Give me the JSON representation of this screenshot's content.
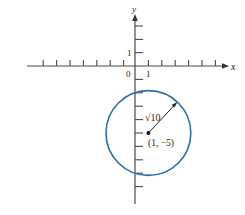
{
  "figure": {
    "type": "circle-on-coordinate-plane",
    "axes": {
      "x_label": "x",
      "y_label": "y",
      "origin_label": "0",
      "x_unit_label": "1",
      "y_unit_label": "1",
      "x_range": [
        -7,
        7
      ],
      "y_range": [
        -9,
        4
      ]
    },
    "circle": {
      "center": [
        1,
        -5
      ],
      "radius_label": "√10",
      "radius_value": 3.1623,
      "center_label": "(1, −5)",
      "color": "#2c6ea6"
    },
    "equation": "(x − 1)² + (y + 5)² = 10"
  }
}
